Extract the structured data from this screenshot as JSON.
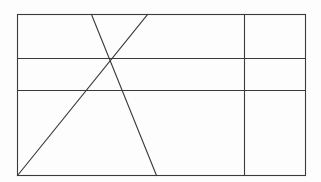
{
  "canvas": {
    "width": 321,
    "height": 182,
    "background_color": "#fdfdfd",
    "stroke_color": "#3a3a3a",
    "stroke_width": 1.1,
    "description": "Line drawing of a rectangle divided by two horizontal lines and one vertical line, with two crossing diagonal lines forming an X"
  },
  "figure": {
    "type": "line-diagram",
    "shapes": [
      {
        "id": "outer-rectangle",
        "name": "outer-rectangle",
        "kind": "rect",
        "x": 17,
        "y": 14,
        "width": 288,
        "height": 161,
        "stroke": "#3a3a3a",
        "fill": "none"
      },
      {
        "id": "horizontal-line-upper",
        "name": "horizontal-divider-upper",
        "kind": "line",
        "x1": 17,
        "y1": 58,
        "x2": 305,
        "y2": 58,
        "stroke": "#3a3a3a"
      },
      {
        "id": "horizontal-line-lower",
        "name": "horizontal-divider-lower",
        "kind": "line",
        "x1": 17,
        "y1": 90,
        "x2": 305,
        "y2": 90,
        "stroke": "#3a3a3a"
      },
      {
        "id": "vertical-line-right",
        "name": "vertical-divider-right",
        "kind": "line",
        "x1": 244,
        "y1": 14,
        "x2": 244,
        "y2": 175,
        "stroke": "#3a3a3a"
      },
      {
        "id": "diagonal-long",
        "name": "diagonal-bottomleft-to-top",
        "kind": "line",
        "x1": 17,
        "y1": 175,
        "x2": 147,
        "y2": 14,
        "stroke": "#3a3a3a"
      },
      {
        "id": "diagonal-steep",
        "name": "diagonal-top-to-bottom",
        "kind": "line",
        "x1": 91,
        "y1": 14,
        "x2": 156,
        "y2": 175,
        "stroke": "#3a3a3a"
      }
    ],
    "intersections": [
      {
        "name": "diagonals-crossing-point",
        "x": 110,
        "y": 59
      }
    ]
  }
}
